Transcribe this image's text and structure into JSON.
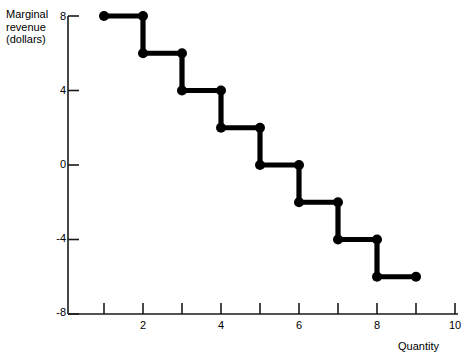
{
  "chart_data": {
    "type": "line",
    "subtype": "step",
    "title": "",
    "ylabel": "Marginal\nrevenue\n(dollars)",
    "xlabel": "Quantity",
    "xlim": [
      0,
      10.6
    ],
    "ylim": [
      -8,
      8
    ],
    "grid": false,
    "legend": null,
    "x_tick_positions": [
      1,
      2,
      3,
      4,
      5,
      6,
      7,
      8,
      9,
      10
    ],
    "x_tick_labels": [
      "",
      "2",
      "",
      "4",
      "",
      "6",
      "",
      "8",
      "",
      "10"
    ],
    "y_tick_positions": [
      8,
      4,
      0,
      -4,
      -8
    ],
    "y_tick_labels": [
      "8",
      "4",
      "0",
      "-4",
      "-8"
    ],
    "steps": [
      {
        "x_start": 1,
        "x_end": 2,
        "y": 8
      },
      {
        "x_start": 2,
        "x_end": 3,
        "y": 6
      },
      {
        "x_start": 3,
        "x_end": 4,
        "y": 4
      },
      {
        "x_start": 4,
        "x_end": 5,
        "y": 2
      },
      {
        "x_start": 5,
        "x_end": 6,
        "y": 0
      },
      {
        "x_start": 6,
        "x_end": 7,
        "y": -2
      },
      {
        "x_start": 7,
        "x_end": 8,
        "y": -4
      },
      {
        "x_start": 8,
        "x_end": 9,
        "y": -6
      }
    ],
    "points": [
      {
        "x": 1,
        "y": 8
      },
      {
        "x": 2,
        "y": 8
      },
      {
        "x": 2,
        "y": 6
      },
      {
        "x": 3,
        "y": 6
      },
      {
        "x": 3,
        "y": 4
      },
      {
        "x": 4,
        "y": 4
      },
      {
        "x": 4,
        "y": 2
      },
      {
        "x": 5,
        "y": 2
      },
      {
        "x": 5,
        "y": 0
      },
      {
        "x": 6,
        "y": 0
      },
      {
        "x": 6,
        "y": -2
      },
      {
        "x": 7,
        "y": -2
      },
      {
        "x": 7,
        "y": -4
      },
      {
        "x": 8,
        "y": -4
      },
      {
        "x": 8,
        "y": -6
      },
      {
        "x": 9,
        "y": -6
      }
    ],
    "series_color": "#000000",
    "axis_color": "#1a1a1a",
    "background_color": "#ffffff"
  },
  "labels": {
    "y_axis_title": "Marginal\nrevenue\n(dollars)",
    "x_axis_title": "Quantity",
    "y_ticks": [
      "8",
      "4",
      "0",
      "-4",
      "-8"
    ],
    "x_ticks": [
      "2",
      "4",
      "6",
      "8",
      "10"
    ]
  }
}
